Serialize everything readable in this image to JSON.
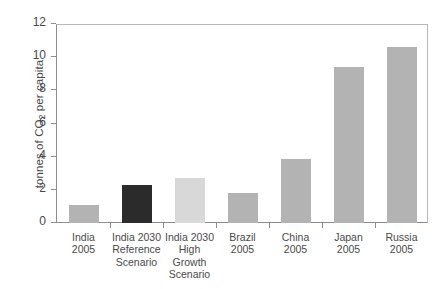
{
  "chart_data": {
    "type": "bar",
    "title": "",
    "xlabel": "",
    "ylabel": "tonnes of CO2 per capita",
    "ylim": [
      0,
      12
    ],
    "ytick_step": 2,
    "grid": false,
    "legend": "none",
    "categories": [
      "India 2005",
      "India 2030 Reference Scenario",
      "India 2030 High Growth Scenario",
      "Brazil 2005",
      "China 2005",
      "Japan 2005",
      "Russia 2005"
    ],
    "values": [
      1.1,
      2.3,
      2.7,
      1.8,
      3.85,
      9.4,
      10.6
    ],
    "bar_colors": [
      "#b3b3b3",
      "#2b2b2b",
      "#d8d8d8",
      "#b3b3b3",
      "#b3b3b3",
      "#b3b3b3",
      "#b3b3b3"
    ]
  },
  "axis": {
    "y_title_prefix": "tonnes of CO",
    "y_title_subscript": "2",
    "y_title_suffix": " per capita",
    "y_ticks": [
      "12",
      "10",
      "8",
      "6",
      "4",
      "2",
      "0"
    ]
  },
  "x_labels": [
    [
      "India",
      "2005"
    ],
    [
      "India 2030",
      "Reference",
      "Scenario"
    ],
    [
      "India 2030",
      "High",
      "Growth",
      "Scenario"
    ],
    [
      "Brazil",
      "2005"
    ],
    [
      "China",
      "2005"
    ],
    [
      "Japan",
      "2005"
    ],
    [
      "Russia",
      "2005"
    ]
  ],
  "colors": {
    "bar_default": "#b3b3b3",
    "bar_dark": "#2b2b2b",
    "bar_light": "#d8d8d8",
    "axis_line": "#8d8d8d",
    "frame_line": "#b9b9b9",
    "text": "#4a4a4a",
    "background": "#ffffff"
  }
}
